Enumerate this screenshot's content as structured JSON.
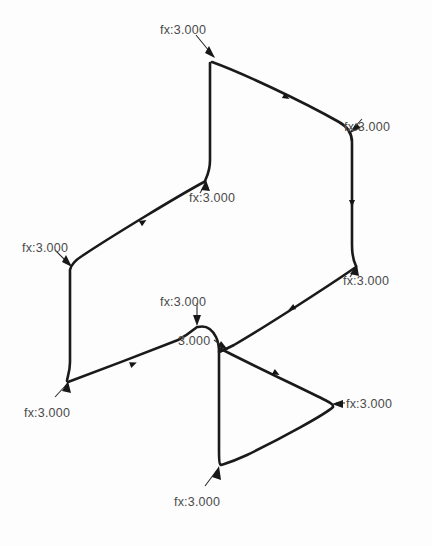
{
  "diagram": {
    "type": "force-annotation-diagram",
    "background_color": "#fdfdfd",
    "curve_color": "#1a1a1a",
    "label_color": "#4a4a4a",
    "leader_color": "#2b2b2b",
    "annotations": [
      {
        "id": "fx-top",
        "text": "fx:3.000",
        "x": 160,
        "y": 24,
        "target_x": 211,
        "target_y": 62,
        "arrow": "down-right"
      },
      {
        "id": "fx-upper-right",
        "text": "fx:3.000",
        "x": 344,
        "y": 121,
        "target_x": 351,
        "target_y": 133,
        "arrow": "down-left"
      },
      {
        "id": "fx-mid-upper",
        "text": "fx:3.000",
        "x": 189,
        "y": 192,
        "target_x": 206,
        "target_y": 180,
        "arrow": "up-right"
      },
      {
        "id": "fx-left",
        "text": "fx:3.000",
        "x": 22,
        "y": 242,
        "target_x": 72,
        "target_y": 268,
        "arrow": "down-right"
      },
      {
        "id": "fx-mid-right",
        "text": "fx:3.000",
        "x": 343,
        "y": 275,
        "target_x": 356,
        "target_y": 266,
        "arrow": "up-right"
      },
      {
        "id": "fx-center-upper",
        "text": "fx:3.000",
        "x": 160,
        "y": 296,
        "target_x": 197,
        "target_y": 326,
        "arrow": "down"
      },
      {
        "id": "fx-center-lower",
        "text": "3.000",
        "x": 178,
        "y": 335,
        "target_x": 228,
        "target_y": 350,
        "arrow": "down-right"
      },
      {
        "id": "fx-bottom-left",
        "text": "fx:3.000",
        "x": 24,
        "y": 407,
        "target_x": 68,
        "target_y": 381,
        "arrow": "up-right"
      },
      {
        "id": "fx-right",
        "text": "fx:3.000",
        "x": 346,
        "y": 398,
        "target_x": 333,
        "target_y": 405,
        "arrow": "left"
      },
      {
        "id": "fx-bottom",
        "text": "fx:3.000",
        "x": 174,
        "y": 496,
        "target_x": 219,
        "target_y": 467,
        "arrow": "up-right"
      }
    ],
    "value": "3.000",
    "prefix": "fx:",
    "annotation_count": 10
  }
}
